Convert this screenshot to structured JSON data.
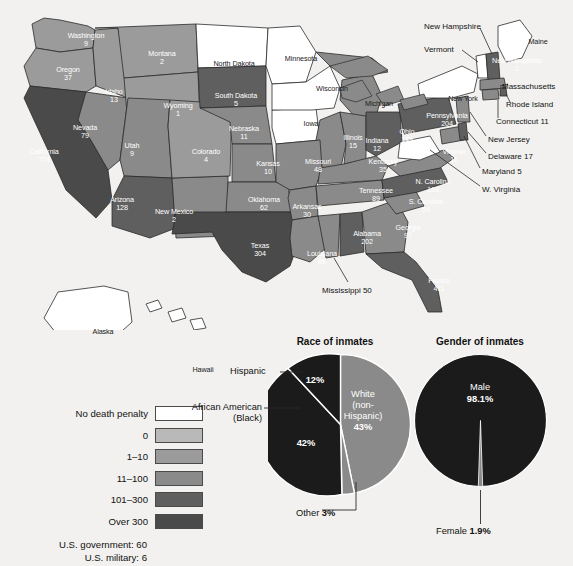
{
  "chart_data": [
    {
      "type": "map",
      "title": "Executions by state",
      "legend_title": "",
      "legend": [
        {
          "label": "No death penalty",
          "color": "#ffffff"
        },
        {
          "label": "0",
          "color": "#b9b9b9"
        },
        {
          "label": "1–10",
          "color": "#9b9b9b"
        },
        {
          "label": "11–100",
          "color": "#8a8a8a"
        },
        {
          "label": "101–300",
          "color": "#5f5f5f"
        },
        {
          "label": "Over 300",
          "color": "#4a4a4a"
        }
      ],
      "footnotes": [
        "U.S. government: 60",
        "U.S. military: 6"
      ],
      "categories": [
        "Washington",
        "Oregon",
        "Idaho",
        "Montana",
        "Wyoming",
        "Nevada",
        "Utah",
        "California",
        "Arizona",
        "New Mexico",
        "Colorado",
        "North Dakota",
        "South Dakota",
        "Nebraska",
        "Kansas",
        "Oklahoma",
        "Texas",
        "Minnesota",
        "Iowa",
        "Missouri",
        "Arkansas",
        "Louisiana",
        "Mississippi",
        "Wisconsin",
        "Illinois",
        "Michigan",
        "Indiana",
        "Ohio",
        "Kentucky",
        "Tennessee",
        "Alabama",
        "Georgia",
        "Florida",
        "S. Carolina",
        "N. Carolina",
        "Virginia",
        "W. Virginia",
        "Maryland",
        "Delaware",
        "Pennsylvania",
        "New Jersey",
        "New York",
        "Connecticut",
        "Rhode Island",
        "Massachusetts",
        "Vermont",
        "New Hampshire",
        "Maine",
        "Alaska",
        "Hawaii"
      ],
      "values": [
        9,
        37,
        13,
        2,
        1,
        79,
        9,
        724,
        128,
        2,
        4,
        null,
        5,
        11,
        10,
        62,
        304,
        null,
        null,
        48,
        30,
        88,
        50,
        null,
        15,
        null,
        12,
        149,
        35,
        89,
        202,
        97,
        411,
        54,
        163,
        11,
        null,
        5,
        17,
        204,
        null,
        null,
        11,
        null,
        null,
        null,
        1,
        null,
        null,
        null
      ],
      "ylabel": "Executions since 1976",
      "xlabel": ""
    },
    {
      "type": "pie",
      "title": "Race of inmates",
      "labels": [
        "White (non-Hispanic)",
        "African American (Black)",
        "Hispanic",
        "Other"
      ],
      "values": [
        43,
        42,
        12,
        3
      ],
      "value_labels": [
        "43%",
        "42%",
        "12%",
        "3%"
      ],
      "colors": [
        "#8a8a8a",
        "#1b1b1b",
        "#1b1b1b",
        "#8a8a8a"
      ],
      "legend_position": "callout"
    },
    {
      "type": "pie",
      "title": "Gender of inmates",
      "labels": [
        "Male",
        "Female"
      ],
      "values": [
        98.1,
        1.9
      ],
      "value_labels": [
        "98.1%",
        "1.9%"
      ],
      "colors": [
        "#1b1b1b",
        "#8a8a8a"
      ],
      "legend_position": "callout"
    }
  ],
  "map": {
    "states": [
      {
        "name": "Washington",
        "value": "9",
        "x": 58,
        "y": 32,
        "tone": "light"
      },
      {
        "name": "Oregon",
        "value": "37",
        "x": 40,
        "y": 66,
        "tone": "light"
      },
      {
        "name": "Idaho",
        "value": "13",
        "x": 86,
        "y": 88,
        "tone": "light"
      },
      {
        "name": "Montana",
        "value": "2",
        "x": 134,
        "y": 50,
        "tone": "light"
      },
      {
        "name": "Wyoming",
        "value": "1",
        "x": 150,
        "y": 102,
        "tone": "light"
      },
      {
        "name": "Nevada",
        "value": "79",
        "x": 57,
        "y": 124,
        "tone": "light"
      },
      {
        "name": "Utah",
        "value": "9",
        "x": 104,
        "y": 142,
        "tone": "light"
      },
      {
        "name": "California",
        "value": "724",
        "x": 16,
        "y": 148,
        "tone": "light"
      },
      {
        "name": "Arizona",
        "value": "128",
        "x": 94,
        "y": 196,
        "tone": "light"
      },
      {
        "name": "New Mexico",
        "value": "2",
        "x": 146,
        "y": 208,
        "tone": "light"
      },
      {
        "name": "Colorado",
        "value": "4",
        "x": 178,
        "y": 148,
        "tone": "light"
      },
      {
        "name": "North Dakota",
        "value": "",
        "x": 206,
        "y": 60,
        "tone": "dark"
      },
      {
        "name": "South Dakota",
        "value": "5",
        "x": 208,
        "y": 92,
        "tone": "light"
      },
      {
        "name": "Nebraska",
        "value": "11",
        "x": 216,
        "y": 125,
        "tone": "light"
      },
      {
        "name": "Kansas",
        "value": "10",
        "x": 240,
        "y": 160,
        "tone": "light"
      },
      {
        "name": "Oklahoma",
        "value": "62",
        "x": 236,
        "y": 196,
        "tone": "light"
      },
      {
        "name": "Texas",
        "value": "304",
        "x": 232,
        "y": 242,
        "tone": "light"
      },
      {
        "name": "Minnesota",
        "value": "",
        "x": 273,
        "y": 55,
        "tone": "dark"
      },
      {
        "name": "Iowa",
        "value": "",
        "x": 283,
        "y": 120,
        "tone": "dark"
      },
      {
        "name": "Missouri",
        "value": "48",
        "x": 290,
        "y": 158,
        "tone": "light"
      },
      {
        "name": "Arkansas",
        "value": "30",
        "x": 279,
        "y": 203,
        "tone": "light"
      },
      {
        "name": "Louisiana",
        "value": "88",
        "x": 294,
        "y": 250,
        "tone": "light"
      },
      {
        "name": "Wisconsin",
        "value": "",
        "x": 304,
        "y": 85,
        "tone": "dark"
      },
      {
        "name": "Illinois",
        "value": "15",
        "x": 325,
        "y": 134,
        "tone": "light"
      },
      {
        "name": "Michigan",
        "value": "",
        "x": 351,
        "y": 100,
        "tone": "dark"
      },
      {
        "name": "Indiana",
        "value": "12",
        "x": 349,
        "y": 137,
        "tone": "light"
      },
      {
        "name": "Ohio",
        "value": "149",
        "x": 379,
        "y": 128,
        "tone": "light"
      },
      {
        "name": "Kentucky",
        "value": "35",
        "x": 355,
        "y": 158,
        "tone": "light"
      },
      {
        "name": "Tennessee",
        "value": "89",
        "x": 348,
        "y": 187,
        "tone": "light"
      },
      {
        "name": "Alabama",
        "value": "202",
        "x": 339,
        "y": 230,
        "tone": "light"
      },
      {
        "name": "Georgia",
        "value": "97",
        "x": 380,
        "y": 224,
        "tone": "light"
      },
      {
        "name": "Florida",
        "value": "411",
        "x": 411,
        "y": 277,
        "tone": "light"
      },
      {
        "name": "S. Carolina",
        "value": "54",
        "x": 398,
        "y": 198,
        "tone": "light"
      },
      {
        "name": "N. Carolina",
        "value": "163",
        "x": 405,
        "y": 178,
        "tone": "light"
      },
      {
        "name": "Virginia",
        "value": "11",
        "x": 426,
        "y": 148,
        "tone": "light"
      },
      {
        "name": "Pennsylvania",
        "value": "204",
        "x": 419,
        "y": 112,
        "tone": "light"
      },
      {
        "name": "New Hampshire",
        "value": "1",
        "x": 489,
        "y": 57,
        "tone": "light"
      },
      {
        "name": "New York",
        "value": "",
        "x": 435,
        "y": 95,
        "tone": "dark"
      },
      {
        "name": "Maine",
        "value": "",
        "x": 510,
        "y": 38,
        "tone": "dark"
      },
      {
        "name": "Alaska",
        "value": "",
        "x": 75,
        "y": 328,
        "tone": "dark"
      },
      {
        "name": "Hawaii",
        "value": "",
        "x": 175,
        "y": 366,
        "tone": "dark"
      }
    ],
    "callouts": [
      {
        "name": "New Hampshire",
        "text": "New Hampshire",
        "x": 424,
        "y": 22
      },
      {
        "name": "Vermont",
        "text": "Vermont",
        "x": 424,
        "y": 45
      },
      {
        "name": "Massachusetts",
        "text": "Massachusetts",
        "x": 502,
        "y": 82
      },
      {
        "name": "Rhode Island",
        "text": "Rhode Island",
        "x": 506,
        "y": 100
      },
      {
        "name": "Connecticut",
        "text": "Connecticut 11",
        "x": 496,
        "y": 117
      },
      {
        "name": "New Jersey",
        "text": "New Jersey",
        "x": 488,
        "y": 135
      },
      {
        "name": "Delaware",
        "text": "Delaware  17",
        "x": 488,
        "y": 152
      },
      {
        "name": "Maryland",
        "text": "Maryland  5",
        "x": 482,
        "y": 167
      },
      {
        "name": "W. Virginia",
        "text": "W. Virginia",
        "x": 482,
        "y": 185
      },
      {
        "name": "Mississippi",
        "text": "Mississippi 50",
        "x": 322,
        "y": 286
      }
    ]
  },
  "race_chart": {
    "title": "Race of inmates",
    "slices": [
      {
        "label": "White (non-Hispanic)",
        "pct": "43%"
      },
      {
        "label": "African American (Black)",
        "pct": "42%"
      },
      {
        "label": "Hispanic",
        "pct": "12%"
      },
      {
        "label": "Other",
        "pct": "3%"
      }
    ],
    "inside_white_l1": "White",
    "inside_white_l2": "(non-",
    "inside_white_l3": "Hispanic)",
    "inside_white_pct": "43%",
    "inside_black_pct": "42%",
    "inside_hisp_pct": "12%",
    "label_hispanic": "Hispanic",
    "label_aa_l1": "African American",
    "label_aa_l2": "(Black)",
    "label_other": "Other",
    "label_other_pct": "3%"
  },
  "gender_chart": {
    "title": "Gender of inmates",
    "inside_male": "Male",
    "inside_male_pct": "98.1%",
    "label_female": "Female",
    "label_female_pct": "1.9%"
  },
  "legend": {
    "items": [
      {
        "label": "No death penalty",
        "color": "#ffffff"
      },
      {
        "label": "0",
        "color": "#b9b9b9"
      },
      {
        "label": "1–10",
        "color": "#9b9b9b"
      },
      {
        "label": "11–100",
        "color": "#8a8a8a"
      },
      {
        "label": "101–300",
        "color": "#5f5f5f"
      },
      {
        "label": "Over 300",
        "color": "#4a4a4a"
      }
    ],
    "footnote1": "U.S. government: 60",
    "footnote2": "U.S. military: 6"
  }
}
